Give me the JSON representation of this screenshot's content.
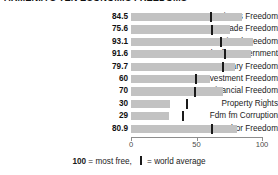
{
  "title": "ARMENIA'S TEN ECONOMIC FREEDOMS",
  "footnote": {
    "scale_max": "100",
    "scale_text": " = most free,",
    "legend_text": " = world average"
  },
  "colors": {
    "bar": "#c2c2c2",
    "average_tick": "#1a1a1a",
    "axis": "#8d8d8d",
    "text": "#1b1b1b"
  },
  "chart_data": {
    "type": "bar",
    "title": "ARMENIA'S TEN ECONOMIC FREEDOMS",
    "xlabel": "",
    "ylabel": "",
    "xlim": [
      0,
      100
    ],
    "grid": false,
    "orientation": "horizontal",
    "legend": [
      "world average"
    ],
    "ticks": [
      "0",
      "50",
      "100"
    ],
    "tick_values": [
      0,
      50,
      100
    ],
    "categories": [
      "Business Freedom",
      "Trade Freedom",
      "Fiscal Freedom",
      "Fdm fm Government",
      "Monetary Freedom",
      "Investment Freedom",
      "Financial Freedom",
      "Property Rights",
      "Fdm fm Corruption",
      "Labor Freedom"
    ],
    "values": [
      84.5,
      75.6,
      93.1,
      91.6,
      79.7,
      60,
      70,
      30,
      29,
      80.9
    ],
    "value_labels": [
      "84.5",
      "75.6",
      "93.1",
      "91.6",
      "79.7",
      "60",
      "70",
      "30",
      "29",
      "80.9"
    ],
    "world_average": [
      61.0,
      61.5,
      68.5,
      72.0,
      70.5,
      49.5,
      48.5,
      43.0,
      40.0,
      62.0
    ]
  }
}
